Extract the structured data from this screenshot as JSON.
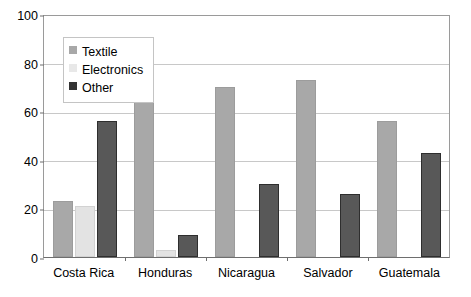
{
  "chart_data": {
    "type": "bar",
    "title": "",
    "subtitle": "",
    "xlabel": "",
    "ylabel": "",
    "ylim": [
      0,
      100
    ],
    "yticks": [
      0,
      20,
      40,
      60,
      80,
      100
    ],
    "grid": true,
    "legend_position": "upper-left-inside",
    "categories": [
      "Costa Rica",
      "Honduras",
      "Nicaragua",
      "Salvador",
      "Guatemala"
    ],
    "series": [
      {
        "name": "Textile",
        "color": "#a8a8a8",
        "values": [
          23,
          88,
          70,
          73,
          56
        ]
      },
      {
        "name": "Electronics",
        "color": "#e3e3e3",
        "values": [
          21,
          3,
          null,
          null,
          null
        ]
      },
      {
        "name": "Other",
        "color": "#585858",
        "values": [
          56,
          9,
          30,
          26,
          43
        ]
      }
    ]
  },
  "legend": {
    "items": [
      {
        "label": "Textile",
        "swatch": "textile"
      },
      {
        "label": "Electronics",
        "swatch": "electronics"
      },
      {
        "label": "Other",
        "swatch": "other"
      }
    ]
  }
}
